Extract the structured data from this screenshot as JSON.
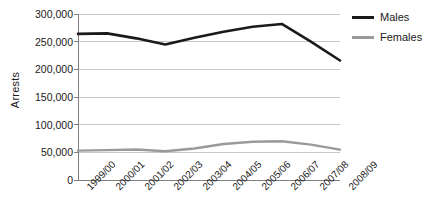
{
  "chart_data": {
    "type": "line",
    "title": "",
    "subtitle": "",
    "xlabel": "",
    "ylabel": "Arrests",
    "categories": [
      "1999/00",
      "2000/01",
      "2001/02",
      "2002/03",
      "2003/04",
      "2004/05",
      "2005/06",
      "2006/07",
      "2007/08",
      "2008/09"
    ],
    "series": [
      {
        "name": "Males",
        "color": "#1a1a1a",
        "values": [
          264000,
          265000,
          256000,
          245000,
          257000,
          268000,
          277000,
          282000,
          250000,
          216000
        ]
      },
      {
        "name": "Females",
        "color": "#9a9a9a",
        "values": [
          53000,
          54000,
          55000,
          52000,
          57000,
          65000,
          69000,
          70000,
          64000,
          55000
        ]
      }
    ],
    "ylim": [
      0,
      300000
    ],
    "ytick_values": [
      0,
      50000,
      100000,
      150000,
      200000,
      250000,
      300000
    ],
    "ytick_labels": [
      "0",
      "50,000",
      "100,000",
      "150,000",
      "200,000",
      "250,000",
      "300,000"
    ],
    "grid": true,
    "grid_axis": "y",
    "grid_color": "#c8c8c8",
    "axis_color": "#808080",
    "legend_position": "right",
    "background": "#ffffff"
  },
  "legend": {
    "items": [
      {
        "label": "Males",
        "color": "#1a1a1a"
      },
      {
        "label": "Females",
        "color": "#9a9a9a"
      }
    ]
  }
}
